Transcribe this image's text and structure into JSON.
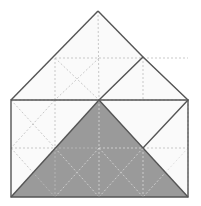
{
  "figure": {
    "canvas": {
      "width": 201,
      "height": 206
    },
    "colors": {
      "background": "#ffffff",
      "face_light": "#fafafa",
      "face_shaded": "#9a9a9a",
      "outline": "#555555",
      "dash_light": "#bbbbbb",
      "dash_on_shade": "#d9d9d9"
    },
    "stroke_widths": {
      "outline": 1.4,
      "dash": 0.8
    },
    "dash_pattern": "2,2",
    "points": {
      "apex_top": [
        98,
        11
      ],
      "base_left_top": [
        11,
        100
      ],
      "base_right_top": [
        188,
        100
      ],
      "base_left_bottom": [
        11,
        197
      ],
      "base_right_bottom": [
        188,
        197
      ],
      "center": [
        99,
        100
      ],
      "diamond_top": [
        143,
        57
      ],
      "diamond_bottom": [
        143,
        148
      ],
      "mid_left_upper": [
        55,
        58
      ],
      "mid_top_edge": [
        99,
        58
      ],
      "mid_left_side": [
        11,
        148
      ],
      "mid_bottom": [
        99,
        197
      ],
      "quarter_left_v": [
        55,
        100
      ],
      "quarter_bottom_mid": [
        55,
        148
      ]
    },
    "shapes": {
      "base_square": "11,100 188,100 188,197 11,197",
      "roof_left_edge": "11,100 98,11",
      "roof_right_edge": "98,11 143,57",
      "diamond": "99,100 143,57 188,100 143,148",
      "shaded_main_triangle": "99,100 188,197 11,197",
      "shaded_small_triangle": "143,148 188,197 99,197"
    },
    "dashed_lines": [
      {
        "name": "horizontal-mid-upper",
        "d": "M 55,58 L 188,58"
      },
      {
        "name": "horizontal-base-top",
        "d": "M 11,100 L 188,100"
      },
      {
        "name": "horizontal-base-mid",
        "d": "M 11,148 L 188,148"
      },
      {
        "name": "vertical-apex",
        "d": "M 98,11 L 99,197"
      },
      {
        "name": "vertical-left-quarter",
        "d": "M 55,58 L 55,197"
      },
      {
        "name": "vertical-diamond",
        "d": "M 143,57 L 143,197"
      },
      {
        "name": "vertical-right-edge",
        "d": "M 188,100 L 188,197"
      },
      {
        "name": "diag-upper-left-sq-a",
        "d": "M 55,58 L 99,100"
      },
      {
        "name": "diag-upper-left-sq-b",
        "d": "M 99,58 L 55,100"
      },
      {
        "name": "diag-left-lower-a",
        "d": "M 11,100 L 55,148"
      },
      {
        "name": "diag-left-lower-b",
        "d": "M 55,100 L 11,148"
      },
      {
        "name": "diag-left-bottom-a",
        "d": "M 11,148 L 55,197"
      },
      {
        "name": "diag-left-bottom-b",
        "d": "M 55,148 L 11,197"
      },
      {
        "name": "diag-center-lower-a",
        "d": "M 55,148 L 99,197"
      },
      {
        "name": "diag-center-lower-b",
        "d": "M 99,148 L 55,197"
      },
      {
        "name": "diag-right-lower-a",
        "d": "M 99,148 L 143,197"
      },
      {
        "name": "diag-right-lower-b",
        "d": "M 143,148 L 99,197"
      },
      {
        "name": "diag-far-right-a",
        "d": "M 143,148 L 188,197"
      },
      {
        "name": "diag-far-right-b",
        "d": "M 188,148 L 143,197"
      },
      {
        "name": "diag-diamond-upper-a",
        "d": "M 99,100 L 143,57"
      },
      {
        "name": "diag-diamond-right",
        "d": "M 143,57 L 188,100"
      }
    ]
  }
}
